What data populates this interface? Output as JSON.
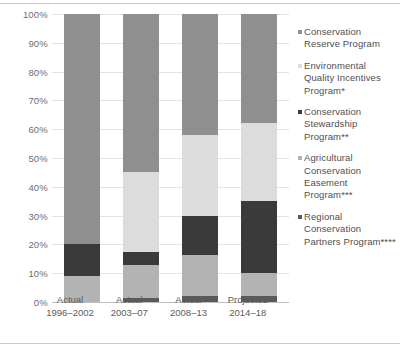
{
  "chart_data": {
    "type": "bar",
    "subtype": "stacked-100-percent",
    "title": "",
    "xlabel": "",
    "ylabel": "",
    "ylim": [
      0,
      100
    ],
    "yticks": [
      "0%",
      "10%",
      "20%",
      "30%",
      "40%",
      "50%",
      "60%",
      "70%",
      "80%",
      "90%",
      "100%"
    ],
    "ytick_values": [
      0,
      10,
      20,
      30,
      40,
      50,
      60,
      70,
      80,
      90,
      100
    ],
    "grid": true,
    "legend_position": "right",
    "categories": [
      "Actual 1996–2002",
      "Actual 2003–07",
      "Actual 2008–13",
      "Projected 2014–18"
    ],
    "category_lines": [
      {
        "line1": "Actual",
        "line2": "1996–2002"
      },
      {
        "line1": "Actual",
        "line2": "2003–07"
      },
      {
        "line1": "Actual",
        "line2": "2008–13"
      },
      {
        "line1": "Projected",
        "line2": "2014–18"
      }
    ],
    "series": [
      {
        "name": "Regional Conservation Partners Program****",
        "short": "RCPP",
        "color": "#5a5a5a",
        "values": [
          0,
          1.5,
          2,
          2
        ]
      },
      {
        "name": "Agricultural Conservation Easement Program***",
        "short": "ACEP",
        "color": "#b3b3b3",
        "values": [
          9,
          11.5,
          14.5,
          8
        ]
      },
      {
        "name": "Conservation Stewardship Program**",
        "short": "CSP",
        "color": "#3a3a3a",
        "values": [
          11,
          4.5,
          13.5,
          25
        ]
      },
      {
        "name": "Environmental Quality Incentives Program*",
        "short": "EQIP",
        "color": "#dcdcdc",
        "values": [
          0,
          27.5,
          28,
          27
        ]
      },
      {
        "name": "Conservation Reserve Program",
        "short": "CRP",
        "color": "#8f8f8f",
        "values": [
          80,
          55,
          42,
          38
        ]
      }
    ]
  },
  "legend": {
    "items": [
      {
        "label": "Conservation Reserve Program",
        "color": "#8f8f8f",
        "marker": "square-marker"
      },
      {
        "label": "Environmental Quality Incentives Program*",
        "color": "#dcdcdc",
        "marker": "square-marker"
      },
      {
        "label": "Conservation Stewardship Program**",
        "color": "#3a3a3a",
        "marker": "square-marker"
      },
      {
        "label": "Agricultural Conservation Easement Program***",
        "color": "#b3b3b3",
        "marker": "square-marker"
      },
      {
        "label": "Regional Conservation Partners Program****",
        "color": "#5a5a5a",
        "marker": "square-marker"
      }
    ]
  }
}
